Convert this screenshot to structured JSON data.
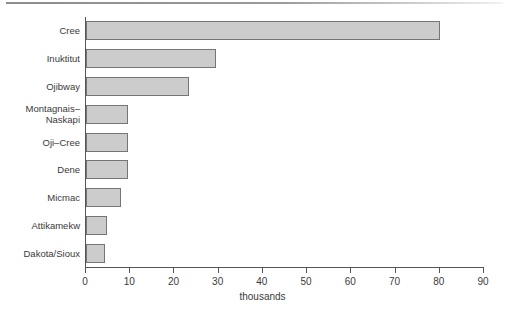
{
  "chart_data": {
    "type": "bar",
    "orientation": "horizontal",
    "title": "",
    "xlabel": "thousands",
    "ylabel": "",
    "xlim": [
      0,
      90
    ],
    "grid": false,
    "legend": null,
    "categories": [
      "Cree",
      "Inuktitut",
      "Ojibway",
      "Montagnais–\nNaskapi",
      "Oji–Cree",
      "Dene",
      "Micmac",
      "Attikamekw",
      "Dakota/Sioux"
    ],
    "values": [
      80,
      29.5,
      23.3,
      9.6,
      9.6,
      9.6,
      8,
      4.7,
      4.3
    ],
    "tick_values": [
      0,
      10,
      20,
      30,
      40,
      50,
      60,
      70,
      80,
      90
    ],
    "tick_labels": [
      "0",
      "10",
      "20",
      "30",
      "40",
      "50",
      "60",
      "70",
      "80",
      "90"
    ],
    "bar_fill_color": "#cccccc",
    "bar_border_color": "#757575",
    "axis_color": "#555555"
  },
  "caption": ""
}
